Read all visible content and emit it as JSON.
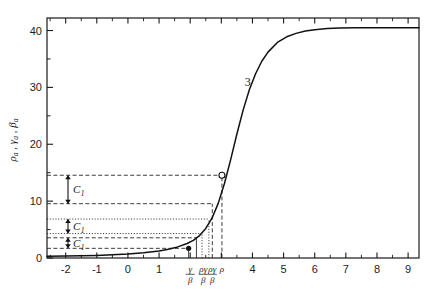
{
  "chart_data": {
    "type": "line",
    "title": "",
    "xlabel": "",
    "ylabel": "ρₐ , γₐ , βₐ",
    "ylabel_parts": [
      "ρ",
      "a",
      ",",
      "γ",
      "a",
      ",",
      "β",
      "a"
    ],
    "xlim": [
      -2.6,
      9.35
    ],
    "ylim": [
      0,
      42.2
    ],
    "grid": false,
    "legend": null,
    "y_ticks_major": [
      0,
      10,
      20,
      30,
      40
    ],
    "y_ticks_major_labels": [
      "0",
      "10",
      "20",
      "30",
      "40"
    ],
    "y_ticks_minor": [
      5,
      15,
      25,
      35
    ],
    "x_ticks_major": [
      -2,
      -1,
      0,
      1,
      2,
      3,
      4,
      5,
      6,
      7,
      8,
      9
    ],
    "x_ticks_major_labels": [
      "-2",
      "-1",
      "0",
      "1",
      "",
      "",
      "4",
      "5",
      "6",
      "7",
      "8",
      "9"
    ],
    "x_fraction_labels": [
      {
        "x": 2.0,
        "num": "γ",
        "den": "β"
      },
      {
        "x": 2.42,
        "num": "ργ",
        "den": "β"
      },
      {
        "x": 2.71,
        "num": "ργ",
        "den": "β"
      },
      {
        "x": 3.02,
        "num": "ρ",
        "den": ""
      }
    ],
    "series": [
      {
        "name": "3",
        "label": "3",
        "label_at": {
          "x": 3.85,
          "y": 30.2
        },
        "x": [
          -2.6,
          -2.0,
          -1.5,
          -1.0,
          -0.5,
          0.0,
          0.5,
          1.0,
          1.3,
          1.6,
          1.9,
          2.1,
          2.3,
          2.5,
          2.7,
          2.9,
          3.1,
          3.3,
          3.5,
          3.7,
          3.9,
          4.1,
          4.3,
          4.5,
          4.8,
          5.1,
          5.4,
          5.7,
          6.0,
          6.4,
          6.8,
          7.3,
          7.8,
          8.4,
          9.0,
          9.35
        ],
        "y": [
          0.3,
          0.33,
          0.38,
          0.45,
          0.55,
          0.7,
          0.92,
          1.25,
          1.55,
          1.95,
          2.55,
          3.1,
          3.95,
          5.2,
          7.0,
          9.6,
          13.1,
          17.3,
          21.8,
          26.0,
          29.6,
          32.4,
          34.6,
          36.2,
          37.9,
          38.9,
          39.5,
          39.9,
          40.15,
          40.35,
          40.45,
          40.5,
          40.5,
          40.5,
          40.5,
          40.5
        ]
      }
    ],
    "markers": [
      {
        "kind": "filled-dot",
        "x": 1.95,
        "y": 1.7
      },
      {
        "kind": "open-circle",
        "x": 3.02,
        "y": 14.55
      }
    ],
    "bracket_annotations": [
      {
        "label": "C",
        "sub": "1",
        "y_top": 14.55,
        "y_bottom": 9.55,
        "style": "dashed"
      },
      {
        "label": "C",
        "sub": "1",
        "y_top": 6.85,
        "y_bottom": 4.3,
        "style": "dotted"
      },
      {
        "label": "C",
        "sub": "1",
        "y_top": 3.55,
        "y_bottom": 1.7,
        "style": "dashed"
      }
    ],
    "horizontal_guides": [
      {
        "y": 14.55,
        "x_from": -2.6,
        "x_to": 3.02,
        "style": "dashed"
      },
      {
        "y": 9.55,
        "x_from": -2.6,
        "x_to": 2.71,
        "style": "dashed"
      },
      {
        "y": 6.85,
        "x_from": -2.6,
        "x_to": 2.6,
        "style": "dotted"
      },
      {
        "y": 4.3,
        "x_from": -2.6,
        "x_to": 2.38,
        "style": "dotted"
      },
      {
        "y": 3.55,
        "x_from": -2.6,
        "x_to": 2.2,
        "style": "dashed"
      },
      {
        "y": 1.7,
        "x_from": -2.6,
        "x_to": 1.95,
        "style": "dashed"
      }
    ],
    "vertical_guides": [
      {
        "x": 1.95,
        "y_from": 0,
        "y_to": 1.7,
        "style": "solid"
      },
      {
        "x": 2.2,
        "y_from": 0,
        "y_to": 3.55,
        "style": "solid"
      },
      {
        "x": 2.38,
        "y_from": 0,
        "y_to": 4.3,
        "style": "dotted"
      },
      {
        "x": 2.6,
        "y_from": 0,
        "y_to": 6.85,
        "style": "dotted"
      },
      {
        "x": 2.71,
        "y_from": 0,
        "y_to": 9.55,
        "style": "dashed"
      },
      {
        "x": 3.02,
        "y_from": 0,
        "y_to": 14.55,
        "style": "dashed"
      }
    ]
  }
}
